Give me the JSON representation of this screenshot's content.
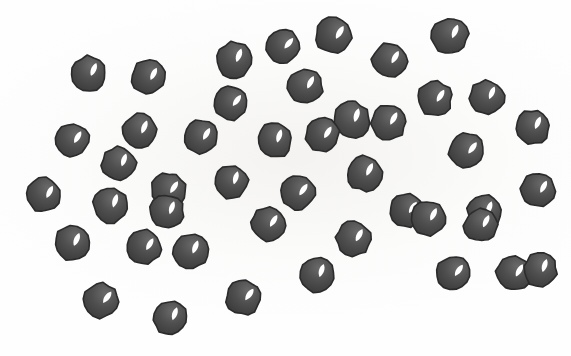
{
  "scene": {
    "title": "Scatter of dark spheres",
    "background_color": "#fefefe",
    "paper_tint_color": "#f3f2f0",
    "width": 571,
    "height": 356,
    "object_count": 45,
    "object_name": "dark-sphere",
    "object_label": "sphere"
  },
  "style": {
    "body_color": "#4f4f4f",
    "body_shade_color": "#3a3a3a",
    "body_light_color": "#6a6a6a",
    "outline_color": "#2b2b2b",
    "highlight_color": "#ffffff",
    "outline_width": 1.6
  },
  "spheres": [
    {
      "id": 1,
      "cx": 88,
      "cy": 73,
      "r": 17.5,
      "rot": -4,
      "hl_angle": 28
    },
    {
      "id": 2,
      "cx": 148,
      "cy": 77,
      "r": 17.0,
      "rot": 6,
      "hl_angle": 22
    },
    {
      "id": 3,
      "cx": 234,
      "cy": 60,
      "r": 18.0,
      "rot": -9,
      "hl_angle": 30
    },
    {
      "id": 4,
      "cx": 231,
      "cy": 103,
      "r": 17.0,
      "rot": 12,
      "hl_angle": 26
    },
    {
      "id": 5,
      "cx": 305,
      "cy": 86,
      "r": 17.5,
      "rot": -6,
      "hl_angle": 34
    },
    {
      "id": 6,
      "cx": 333,
      "cy": 35,
      "r": 18.5,
      "rot": 8,
      "hl_angle": 24
    },
    {
      "id": 7,
      "cx": 352,
      "cy": 120,
      "r": 18.0,
      "rot": -12,
      "hl_angle": 30
    },
    {
      "id": 8,
      "cx": 389,
      "cy": 60,
      "r": 17.5,
      "rot": 4,
      "hl_angle": 27
    },
    {
      "id": 9,
      "cx": 450,
      "cy": 36,
      "r": 18.0,
      "rot": -7,
      "hl_angle": 31
    },
    {
      "id": 10,
      "cx": 434,
      "cy": 98,
      "r": 17.5,
      "rot": 10,
      "hl_angle": 23
    },
    {
      "id": 11,
      "cx": 487,
      "cy": 97,
      "r": 17.0,
      "rot": -5,
      "hl_angle": 29
    },
    {
      "id": 12,
      "cx": 72,
      "cy": 140,
      "r": 17.0,
      "rot": 7,
      "hl_angle": 25
    },
    {
      "id": 13,
      "cx": 139,
      "cy": 131,
      "r": 17.5,
      "rot": -8,
      "hl_angle": 32
    },
    {
      "id": 14,
      "cx": 201,
      "cy": 137,
      "r": 17.0,
      "rot": 5,
      "hl_angle": 26
    },
    {
      "id": 15,
      "cx": 274,
      "cy": 140,
      "r": 17.5,
      "rot": -10,
      "hl_angle": 28
    },
    {
      "id": 16,
      "cx": 322,
      "cy": 135,
      "r": 17.0,
      "rot": 9,
      "hl_angle": 24
    },
    {
      "id": 17,
      "cx": 388,
      "cy": 122,
      "r": 17.5,
      "rot": -3,
      "hl_angle": 33
    },
    {
      "id": 18,
      "cx": 466,
      "cy": 150,
      "r": 17.5,
      "rot": 11,
      "hl_angle": 27
    },
    {
      "id": 19,
      "cx": 533,
      "cy": 127,
      "r": 17.0,
      "rot": -6,
      "hl_angle": 30
    },
    {
      "id": 20,
      "cx": 44,
      "cy": 195,
      "r": 17.0,
      "rot": 6,
      "hl_angle": 22
    },
    {
      "id": 21,
      "cx": 110,
      "cy": 205,
      "r": 17.5,
      "rot": -11,
      "hl_angle": 29
    },
    {
      "id": 22,
      "cx": 168,
      "cy": 190,
      "r": 17.5,
      "rot": 3,
      "hl_angle": 31
    },
    {
      "id": 23,
      "cx": 231,
      "cy": 182,
      "r": 17.0,
      "rot": -7,
      "hl_angle": 25
    },
    {
      "id": 24,
      "cx": 297,
      "cy": 192,
      "r": 17.5,
      "rot": 8,
      "hl_angle": 28
    },
    {
      "id": 25,
      "cx": 364,
      "cy": 173,
      "r": 17.5,
      "rot": -5,
      "hl_angle": 32
    },
    {
      "id": 26,
      "cx": 407,
      "cy": 210,
      "r": 17.0,
      "rot": 10,
      "hl_angle": 26
    },
    {
      "id": 27,
      "cx": 484,
      "cy": 212,
      "r": 17.5,
      "rot": -9,
      "hl_angle": 30
    },
    {
      "id": 28,
      "cx": 538,
      "cy": 190,
      "r": 17.0,
      "rot": 5,
      "hl_angle": 24
    },
    {
      "id": 29,
      "cx": 71,
      "cy": 243,
      "r": 17.5,
      "rot": -4,
      "hl_angle": 28
    },
    {
      "id": 30,
      "cx": 144,
      "cy": 247,
      "r": 17.0,
      "rot": 9,
      "hl_angle": 23
    },
    {
      "id": 31,
      "cx": 190,
      "cy": 251,
      "r": 17.5,
      "rot": -8,
      "hl_angle": 31
    },
    {
      "id": 32,
      "cx": 268,
      "cy": 224,
      "r": 17.0,
      "rot": 6,
      "hl_angle": 27
    },
    {
      "id": 33,
      "cx": 317,
      "cy": 275,
      "r": 17.0,
      "rot": -10,
      "hl_angle": 29
    },
    {
      "id": 34,
      "cx": 353,
      "cy": 238,
      "r": 17.5,
      "rot": 4,
      "hl_angle": 25
    },
    {
      "id": 35,
      "cx": 428,
      "cy": 218,
      "r": 17.5,
      "rot": -6,
      "hl_angle": 33
    },
    {
      "id": 36,
      "cx": 453,
      "cy": 273,
      "r": 17.0,
      "rot": 11,
      "hl_angle": 26
    },
    {
      "id": 37,
      "cx": 481,
      "cy": 225,
      "r": 17.0,
      "rot": -3,
      "hl_angle": 30
    },
    {
      "id": 38,
      "cx": 513,
      "cy": 273,
      "r": 17.5,
      "rot": 7,
      "hl_angle": 24
    },
    {
      "id": 39,
      "cx": 540,
      "cy": 270,
      "r": 17.0,
      "rot": -9,
      "hl_angle": 28
    },
    {
      "id": 40,
      "cx": 101,
      "cy": 300,
      "r": 17.5,
      "rot": 5,
      "hl_angle": 32
    },
    {
      "id": 41,
      "cx": 170,
      "cy": 318,
      "r": 17.0,
      "rot": -7,
      "hl_angle": 27
    },
    {
      "id": 42,
      "cx": 243,
      "cy": 297,
      "r": 17.5,
      "rot": 8,
      "hl_angle": 29
    },
    {
      "id": 43,
      "cx": 119,
      "cy": 164,
      "r": 17.0,
      "rot": -5,
      "hl_angle": 25
    },
    {
      "id": 44,
      "cx": 283,
      "cy": 46,
      "r": 17.0,
      "rot": 10,
      "hl_angle": 31
    },
    {
      "id": 45,
      "cx": 167,
      "cy": 212,
      "r": 17.0,
      "rot": -6,
      "hl_angle": 26
    }
  ]
}
